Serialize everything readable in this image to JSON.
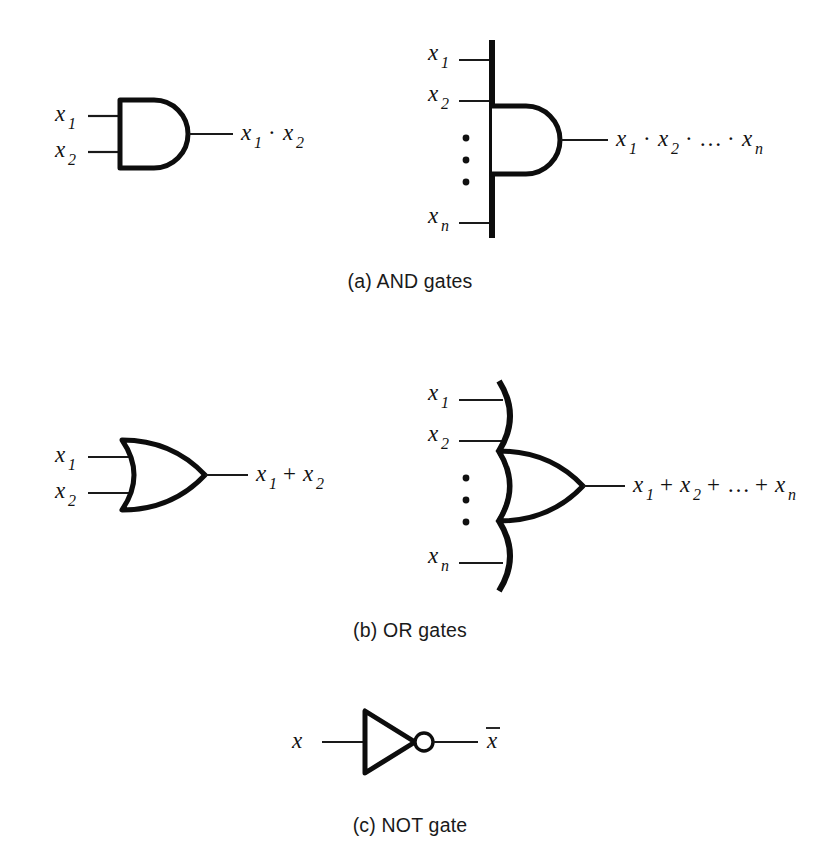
{
  "figure": {
    "background_color": "#ffffff",
    "ink_color": "#0d0d0d",
    "wire_color": "#1a1a1a"
  },
  "sections": [
    {
      "id": "and",
      "caption": "(a) AND gates",
      "gates": [
        {
          "id": "and2",
          "kind": "AND",
          "inputs": [
            "x",
            "x"
          ],
          "input_subscripts": [
            "1",
            "2"
          ],
          "output_terms": [
            "x",
            "x"
          ],
          "output_subscripts": [
            "1",
            "2"
          ],
          "operator": "·",
          "output_expression": "x1 · x2"
        },
        {
          "id": "andn",
          "kind": "AND",
          "inputs": [
            "x",
            "x",
            "x"
          ],
          "input_subscripts": [
            "1",
            "2",
            "n"
          ],
          "ellipsis": "vertical-dots",
          "operator": "·",
          "ellipsis_glyph": "…",
          "output_expression": "x1 · x2 · … · xn"
        }
      ]
    },
    {
      "id": "or",
      "caption": "(b) OR gates",
      "gates": [
        {
          "id": "or2",
          "kind": "OR",
          "inputs": [
            "x",
            "x"
          ],
          "input_subscripts": [
            "1",
            "2"
          ],
          "operator": "+",
          "output_expression": "x1 + x2"
        },
        {
          "id": "orn",
          "kind": "OR",
          "inputs": [
            "x",
            "x",
            "x"
          ],
          "input_subscripts": [
            "1",
            "2",
            "n"
          ],
          "ellipsis": "vertical-dots",
          "operator": "+",
          "ellipsis_glyph": "…",
          "output_expression": "x1 + x2 + … + xn"
        }
      ]
    },
    {
      "id": "not",
      "caption": "(c) NOT gate",
      "gates": [
        {
          "id": "not1",
          "kind": "NOT",
          "inputs": [
            "x"
          ],
          "input_subscripts": [
            ""
          ],
          "output_expression": "x̄",
          "has_inversion_bubble": true
        }
      ]
    }
  ],
  "labels": {
    "x": "x",
    "sub_1": "1",
    "sub_2": "2",
    "sub_n": "n",
    "dot_op": "·",
    "plus_op": "+",
    "ellipsis": "…"
  },
  "captions": {
    "a": "(a) AND gates",
    "b": "(b) OR gates",
    "c": "(c) NOT gate"
  }
}
